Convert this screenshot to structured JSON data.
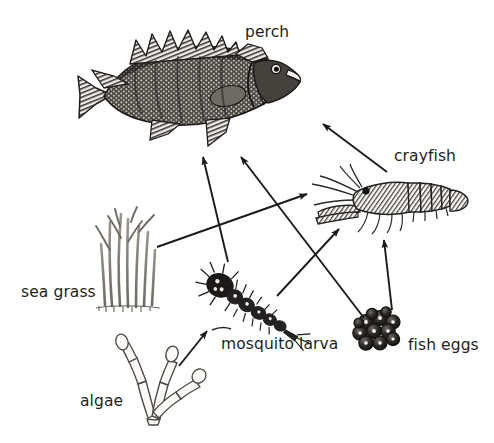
{
  "diagram": {
    "type": "food-web",
    "background_color": "#ffffff",
    "ink_color": "#231f20",
    "organisms": [
      {
        "id": "perch",
        "label": "perch",
        "kind": "fish",
        "trophic_level": "top predator",
        "x": 188,
        "y": 85
      },
      {
        "id": "crayfish",
        "label": "crayfish",
        "kind": "crustacean",
        "trophic_level": "consumer",
        "x": 390,
        "y": 200
      },
      {
        "id": "sea_grass",
        "label": "sea grass",
        "kind": "plant",
        "trophic_level": "producer",
        "x": 125,
        "y": 260
      },
      {
        "id": "mosquito_larva",
        "label": "mosquito larva",
        "kind": "insect",
        "trophic_level": "consumer",
        "x": 255,
        "y": 302
      },
      {
        "id": "fish_eggs",
        "label": "fish eggs",
        "kind": "eggs",
        "trophic_level": "consumer",
        "x": 379,
        "y": 332
      },
      {
        "id": "algae",
        "label": "algae",
        "kind": "plant",
        "trophic_level": "producer",
        "x": 160,
        "y": 395
      }
    ],
    "arrows": [
      {
        "from": "sea_grass",
        "to": "crayfish",
        "x1": 157,
        "y1": 247,
        "x2": 307,
        "y2": 194
      },
      {
        "from": "mosquito_larva",
        "to": "perch",
        "x1": 228,
        "y1": 262,
        "x2": 203,
        "y2": 157
      },
      {
        "from": "fish_eggs",
        "to": "perch",
        "x1": 364,
        "y1": 318,
        "x2": 241,
        "y2": 157
      },
      {
        "from": "crayfish",
        "to": "perch",
        "x1": 387,
        "y1": 172,
        "x2": 323,
        "y2": 124
      },
      {
        "from": "mosquito_larva",
        "to": "crayfish",
        "x1": 277,
        "y1": 296,
        "x2": 339,
        "y2": 229
      },
      {
        "from": "fish_eggs",
        "to": "crayfish",
        "x1": 392,
        "y1": 310,
        "x2": 384,
        "y2": 240
      },
      {
        "from": "algae",
        "to": "mosquito_larva",
        "x1": 179,
        "y1": 366,
        "x2": 207,
        "y2": 331
      }
    ]
  }
}
